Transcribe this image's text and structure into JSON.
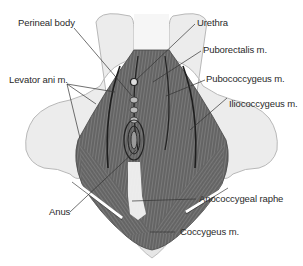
{
  "diagram": {
    "labels": {
      "perineal_body": "Perineal body",
      "urethra": "Urethra",
      "puborectalis": "Puborectalis m.",
      "levator_ani": "Levator ani m.",
      "pubococcygeus": "Pubococcygeus m.",
      "iliococcygeus": "Iliococcygeus m.",
      "anus": "Anus",
      "anococcygeal_raphe": "Anococcygeal raphe",
      "coccygeus": "Coccygeus m."
    },
    "colors": {
      "bone": "#ececec",
      "bone_outline": "#b8b8b8",
      "muscle": "#6e6e6e",
      "muscle_dark": "#3a3a3a",
      "leader_line": "#333333",
      "text": "#2a2a2a"
    }
  }
}
